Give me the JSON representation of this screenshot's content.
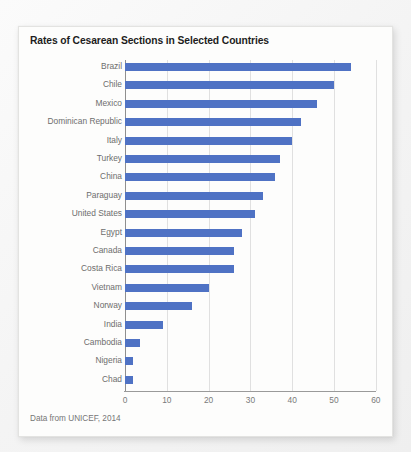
{
  "card": {
    "title": "Rates of Cesarean Sections in Selected Countries",
    "source_note": "Data from UNICEF, 2014"
  },
  "colors": {
    "bar": "#4f72c4",
    "gridline": "#e0e0e0",
    "axis": "#8f8f8f",
    "label": "#6d6d6d",
    "title": "#1d1d1d",
    "card_background": "#fdfdfc",
    "page_background": "#f2f2f2"
  },
  "chart_data": {
    "type": "bar",
    "orientation": "horizontal",
    "title": "Rates of Cesarean Sections in Selected Countries",
    "xlabel": "",
    "ylabel": "",
    "xlim": [
      0,
      60
    ],
    "grid": true,
    "legend": "none",
    "xticks": [
      0,
      10,
      20,
      30,
      40,
      50,
      60
    ],
    "xtick_labels": [
      "0",
      "10",
      "20",
      "30",
      "40",
      "50",
      "60"
    ],
    "categories": [
      "Brazil",
      "Chile",
      "Mexico",
      "Dominican Republic",
      "Italy",
      "Turkey",
      "China",
      "Paraguay",
      "United States",
      "Egypt",
      "Canada",
      "Costa Rica",
      "Vietnam",
      "Norway",
      "India",
      "Cambodia",
      "Nigeria",
      "Chad"
    ],
    "values": [
      54,
      50,
      46,
      42,
      40,
      37,
      36,
      33,
      31,
      28,
      26,
      26,
      20,
      16,
      9,
      3.5,
      2,
      2
    ],
    "annotation": "Data from UNICEF, 2014"
  }
}
